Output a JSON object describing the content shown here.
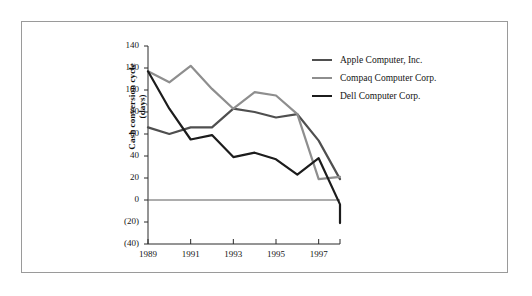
{
  "chart_data": {
    "type": "line",
    "title": "",
    "xlabel": "",
    "ylabel": "Cash conversion cycle (days)",
    "ylabel_line1": "Cash conversion cycle",
    "ylabel_line2": "(days)",
    "x": [
      1989,
      1990,
      1991,
      1992,
      1993,
      1994,
      1995,
      1996,
      1997,
      1998
    ],
    "categories": [
      "1989",
      "1990",
      "1991",
      "1992",
      "1993",
      "1994",
      "1995",
      "1996",
      "1997",
      "1998"
    ],
    "xtick_labels": [
      "1989",
      "1991",
      "1993",
      "1995",
      "1997"
    ],
    "xtick_values": [
      1989,
      1991,
      1993,
      1995,
      1997
    ],
    "ytick_labels": [
      "140",
      "120",
      "100",
      "80",
      "60",
      "40",
      "20",
      "0",
      "(20)",
      "(40)"
    ],
    "ytick_values": [
      140,
      120,
      100,
      80,
      60,
      40,
      20,
      0,
      -20,
      -40
    ],
    "xlim": [
      1989,
      1998
    ],
    "ylim": [
      -40,
      140
    ],
    "grid": false,
    "legend_position": "top-right",
    "zero_line": true,
    "series": [
      {
        "name": "Apple Computer, Inc.",
        "color": "#4f4f4f",
        "values": [
          66,
          60,
          66,
          66,
          83,
          80,
          75,
          78,
          54,
          19
        ]
      },
      {
        "name": "Compaq Computer Corp.",
        "color": "#8e8e8e",
        "values": [
          117,
          107,
          122,
          101,
          83,
          98,
          95,
          78,
          19,
          21
        ]
      },
      {
        "name": "Dell Computer Corp.",
        "color": "#1c1c1c",
        "values": [
          117,
          83,
          55,
          59,
          39,
          43,
          37,
          23,
          38,
          -4
        ]
      }
    ],
    "series_extra": [
      {
        "name": "Dell Computer Corp.",
        "note": "final point",
        "values": [
          -21
        ]
      }
    ]
  },
  "legend": {
    "items": [
      {
        "label": "Apple Computer, Inc.",
        "color": "#4f4f4f"
      },
      {
        "label": "Compaq Computer Corp.",
        "color": "#8e8e8e"
      },
      {
        "label": "Dell Computer Corp.",
        "color": "#1c1c1c"
      }
    ]
  },
  "axes": {
    "y_title_line1": "Cash conversion cycle",
    "y_title_line2": "(days)",
    "y_ticks": [
      "140",
      "120",
      "100",
      "80",
      "60",
      "40",
      "20",
      "0",
      "(20)",
      "(40)"
    ],
    "x_ticks": [
      "1989",
      "1991",
      "1993",
      "1995",
      "1997"
    ]
  },
  "colors": {
    "frame": "#9a9a9a",
    "axis": "#2a2a2a",
    "background": "#ffffff",
    "apple": "#4f4f4f",
    "compaq": "#8e8e8e",
    "dell": "#1c1c1c"
  }
}
